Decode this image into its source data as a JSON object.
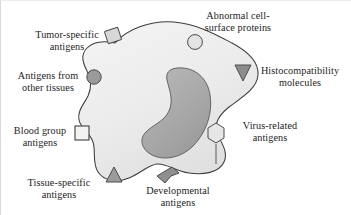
{
  "figure": {
    "background_color": "#ffffff",
    "text_color": "#1d1d1d"
  },
  "cell": {
    "name": "cell-body",
    "membrane_fill": "#eeeeee",
    "membrane_stroke": "#3c3c3c",
    "nucleus_fill": "#a9a9a9",
    "nucleus_stroke": "#4a4a4a"
  },
  "labels": [
    {
      "id": "tumor-specific-antigens",
      "lines": [
        "Tumor-specific",
        "antigens"
      ],
      "marker": "rotated-square",
      "marker_fill": "#d7d7d7"
    },
    {
      "id": "abnormal-cell-surface-proteins",
      "lines": [
        "Abnormal cell-",
        "surface proteins"
      ],
      "marker": "circle-light",
      "marker_fill": "#e2e2e2"
    },
    {
      "id": "histocompatibility-molecules",
      "lines": [
        "Histocompatibility",
        "molecules"
      ],
      "marker": "triangle-down",
      "marker_fill": "#8c8c8c"
    },
    {
      "id": "antigens-from-other-tissues",
      "lines": [
        "Antigens from",
        "other tissues"
      ],
      "marker": "circle-dark",
      "marker_fill": "#9a9a9a"
    },
    {
      "id": "virus-related-antigens",
      "lines": [
        "Virus-related",
        "antigens"
      ],
      "marker": "hexagon",
      "marker_fill": "#e4e4e4"
    },
    {
      "id": "blood-group-antigens",
      "lines": [
        "Blood group",
        "antigens"
      ],
      "marker": "square",
      "marker_fill": "#f2f2f2"
    },
    {
      "id": "tissue-specific-antigens",
      "lines": [
        "Tissue-specific",
        "antigens"
      ],
      "marker": "triangle-up",
      "marker_fill": "#9c9c9c"
    },
    {
      "id": "developmental-antigens",
      "lines": [
        "Developmental",
        "antigens"
      ],
      "marker": "chevron",
      "marker_fill": "#8f8f8f"
    }
  ]
}
